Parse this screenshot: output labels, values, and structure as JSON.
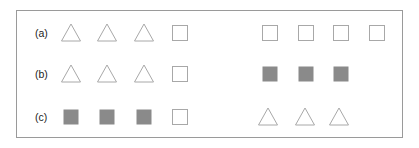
{
  "figure": {
    "rows": [
      {
        "label": "(a)",
        "left_group": [
          "triangle-outline",
          "triangle-outline",
          "triangle-outline",
          "square-outline"
        ],
        "right_group": [
          "square-outline",
          "square-outline",
          "square-outline",
          "square-outline"
        ]
      },
      {
        "label": "(b)",
        "left_group": [
          "triangle-outline",
          "triangle-outline",
          "triangle-outline",
          "square-outline"
        ],
        "right_group": [
          "square-filled",
          "square-filled",
          "square-filled"
        ]
      },
      {
        "label": "(c)",
        "left_group": [
          "square-filled",
          "square-filled",
          "square-filled",
          "square-outline"
        ],
        "right_group": [
          "triangle-outline",
          "triangle-outline",
          "triangle-outline"
        ]
      }
    ],
    "colors": {
      "outline": "#a8a8a8",
      "fill": "#8a8a8a",
      "frame": "#9a9a9a",
      "label": "#222222"
    }
  }
}
